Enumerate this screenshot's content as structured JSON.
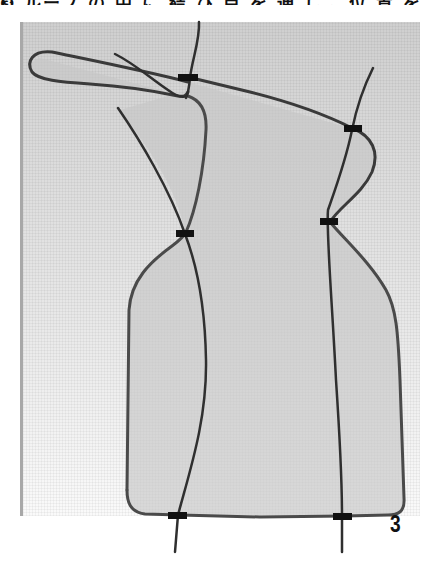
{
  "caption": {
    "text": "❸ ループ の 中 に 結 び 目 を 通 し 、位 置 を 調 整 し た ら"
  },
  "figure": {
    "step_number": "3",
    "colors": {
      "string": "#3a3a3a",
      "fill": "#c8c8c8",
      "marker": "#111111",
      "background_top": "#cfcfcf",
      "background_bottom": "#fafafa"
    },
    "markers": [
      {
        "name": "top-left-marker",
        "x": 188,
        "y": 77
      },
      {
        "name": "top-right-marker",
        "x": 353,
        "y": 129
      },
      {
        "name": "middle-left-marker",
        "x": 185,
        "y": 234
      },
      {
        "name": "middle-right-marker",
        "x": 329,
        "y": 221
      },
      {
        "name": "bottom-left-marker",
        "x": 178,
        "y": 515
      },
      {
        "name": "bottom-right-marker",
        "x": 342,
        "y": 516
      }
    ]
  }
}
